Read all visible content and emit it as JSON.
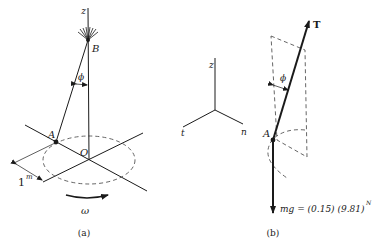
{
  "figure_a": {
    "caption": "(a)",
    "labels": {
      "z_axis": "z",
      "point_b": "B",
      "angle": "ϕ",
      "point_a": "A",
      "origin": "O",
      "dimension": "1",
      "dimension_unit": "m",
      "angular_velocity": "ω"
    }
  },
  "coordinate_frame": {
    "z": "z",
    "t": "t",
    "n": "n"
  },
  "figure_b": {
    "caption": "(b)",
    "labels": {
      "tension": "T",
      "angle": "ϕ",
      "point_a": "A",
      "weight": "mg = (0.15) (9.81)",
      "weight_unit": "N"
    }
  },
  "colors": {
    "ink": "#1a1a1a",
    "dashed": "#555555",
    "background": "#ffffff"
  }
}
